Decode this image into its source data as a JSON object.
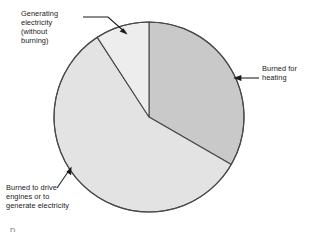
{
  "chart_data": {
    "type": "pie",
    "title": "",
    "subtitle": "",
    "xlabel": "",
    "ylabel": "",
    "grid": false,
    "legend_position": "callout-labels",
    "units": "percent of share (estimated from slice angles)",
    "categories": [
      "Burned for heating",
      "Burned to drive engines or to generate electricity",
      "Generating electricity (without burning)"
    ],
    "values": [
      33,
      58,
      9
    ],
    "slices": [
      {
        "label": "Burned for heating",
        "label_lines": "Burned for\nheating",
        "value": 33,
        "start_angle_deg": 0,
        "end_angle_deg": 120,
        "color": "#c9c9c9",
        "callout_side": "right"
      },
      {
        "label": "Burned to drive engines or to generate electricity",
        "label_lines": "Burned to drive\nengines or to\ngenerate electricity",
        "value": 58,
        "start_angle_deg": 120,
        "end_angle_deg": 327,
        "color": "#e3e3e3",
        "callout_side": "bottom-left"
      },
      {
        "label": "Generating electricity (without burning)",
        "label_lines": "Generating\nelectricity\n(without\nburning)",
        "value": 9,
        "start_angle_deg": 327,
        "end_angle_deg": 360,
        "color": "#ededed",
        "callout_side": "top-left"
      }
    ],
    "geometry": {
      "center_x": 149,
      "center_y": 117,
      "radius": 95
    },
    "colors": {
      "outline": "#4a4a4a",
      "leader_line": "#1a1a1a",
      "background": "#ffffff",
      "text": "#1a1a1a"
    }
  },
  "labels": {
    "generating": "Generating\nelectricity\n(without\nburning)",
    "heating": "Burned for\nheating",
    "engines": "Burned to drive\nengines or to\ngenerate electricity"
  },
  "footer": {
    "clipped_text": "D"
  }
}
